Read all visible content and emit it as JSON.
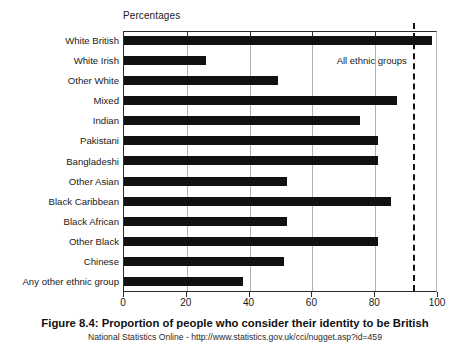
{
  "chart_data": {
    "type": "bar",
    "orientation": "horizontal",
    "title": "Figure 8.4: Proportion of people who consider their identity to be British",
    "subtitle": "National Statistics Online - http://www.statistics.gov.uk/cci/nugget.asp?id=459",
    "axis_title": "Percentages",
    "xlabel": "Percentages",
    "ylabel": "",
    "xlim": [
      0,
      100
    ],
    "xticks": [
      0,
      20,
      40,
      60,
      80,
      100
    ],
    "xtick_labels": [
      "0",
      "20",
      "40",
      "60",
      "80",
      "100"
    ],
    "grid": true,
    "grid_axis": "x",
    "legend": "none",
    "bar_color": "#111111",
    "categories": [
      "White British",
      "White Irish",
      "Other White",
      "Mixed",
      "Indian",
      "Pakistani",
      "Bangladeshi",
      "Other Asian",
      "Black Caribbean",
      "Black African",
      "Other Black",
      "Chinese",
      "Any other ethnic group"
    ],
    "values": [
      98,
      26,
      49,
      87,
      75,
      81,
      81,
      52,
      85,
      52,
      81,
      51,
      38
    ],
    "annotations": [
      {
        "label": "All ethnic groups",
        "type": "vertical-reference-line",
        "value": 92,
        "style": "dashed"
      }
    ]
  },
  "caption": {
    "figure_number": "Figure 8.4",
    "separator": ": ",
    "title": "Proportion of people who consider their identity to be British",
    "source": "National Statistics Online - http://www.statistics.gov.uk/cci/nugget.asp?id=459"
  }
}
